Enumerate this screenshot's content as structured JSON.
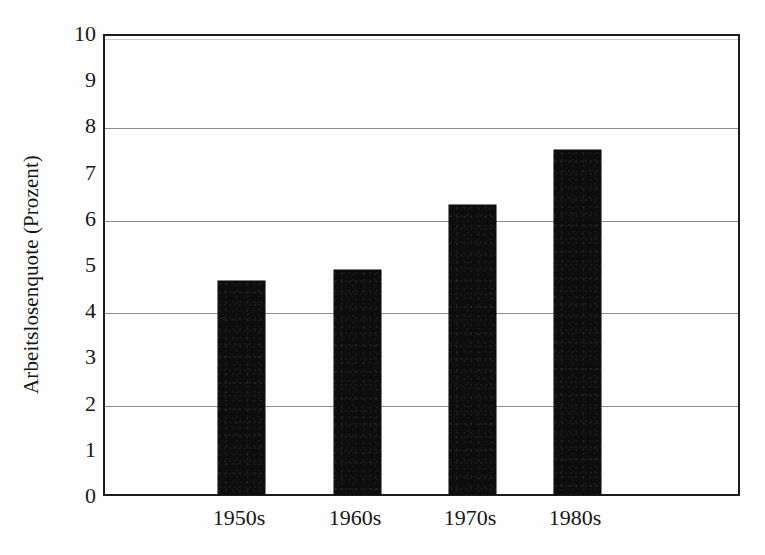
{
  "chart_data": {
    "type": "bar",
    "title": "",
    "subtitle": "",
    "xlabel": "",
    "ylabel": "Arbeitslosenquote (Prozent)",
    "categories": [
      "1950s",
      "1960s",
      "1970s",
      "1980s"
    ],
    "values": [
      4.6,
      4.85,
      6.25,
      7.45
    ],
    "series": [
      {
        "name": "Arbeitslosenquote",
        "values": [
          4.6,
          4.85,
          6.25,
          7.45
        ]
      }
    ],
    "ylim": [
      0,
      10
    ],
    "xlim": [
      0,
      4
    ],
    "y_ticks": [
      10,
      9,
      8,
      7,
      6,
      5,
      4,
      3,
      2,
      1,
      0
    ],
    "y_tick_labels": [
      "10",
      "9",
      "8",
      "7",
      "6",
      "5",
      "4",
      "3",
      "2",
      "1",
      "0"
    ],
    "gridlines": {
      "horizontal": true,
      "vertical": false,
      "values": [
        2,
        4,
        6,
        8
      ]
    },
    "legend": {
      "visible": false,
      "position": "none",
      "entries": []
    },
    "annotations": [],
    "colors": {
      "bar_fill": "#0d0d0d",
      "bar_edge": "#000000",
      "gridline": "#8c8c8c",
      "axis_frame": "#1c1c1c",
      "plot_background": "#ffffff",
      "figure_background": "#fefefe",
      "text": "#171717"
    }
  },
  "axis": {
    "y_title": "Arbeitslosenquote (Prozent)",
    "y_tick_labels": [
      "10",
      "9",
      "8",
      "7",
      "6",
      "5",
      "4",
      "3",
      "2",
      "1",
      "0"
    ],
    "x_tick_labels": [
      "1950s",
      "1960s",
      "1970s",
      "1980s"
    ]
  }
}
